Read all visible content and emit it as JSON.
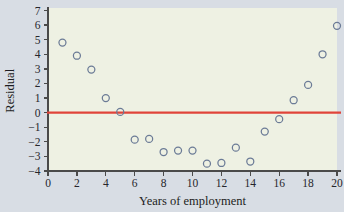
{
  "chart_data": {
    "type": "scatter",
    "title": "",
    "xlabel": "Years of employment",
    "ylabel": "Residual",
    "xlim": [
      0,
      20
    ],
    "ylim": [
      -4,
      7
    ],
    "xticks": [
      0,
      2,
      4,
      6,
      8,
      10,
      12,
      14,
      16,
      18,
      20
    ],
    "yticks": [
      -4,
      -3,
      -2,
      -1,
      0,
      1,
      2,
      3,
      4,
      5,
      6,
      7
    ],
    "xtick_labels": [
      "0",
      "2",
      "4",
      "6",
      "8",
      "10",
      "12",
      "14",
      "16",
      "18",
      "20"
    ],
    "ytick_labels": [
      "−4",
      "−3",
      "−2",
      "−1",
      "0",
      "1",
      "2",
      "3",
      "4",
      "5",
      "6",
      "7"
    ],
    "grid": false,
    "legend": "none",
    "marker": "open-circle",
    "marker_color": "#6b7b96",
    "panel_color": "#eef1e3",
    "figure_color": "#d8dde4",
    "reference_line": {
      "name": "zero-residual-line",
      "orientation": "horizontal",
      "y": 0,
      "color": "#e0443a"
    },
    "x": [
      1,
      2,
      3,
      4,
      5,
      6,
      7,
      8,
      9,
      10,
      11,
      12,
      13,
      14,
      15,
      16,
      17,
      18,
      19,
      20
    ],
    "y": [
      4.8,
      3.9,
      2.95,
      1.0,
      0.05,
      -1.85,
      -1.8,
      -2.7,
      -2.6,
      -2.6,
      -3.5,
      -3.45,
      -2.4,
      -3.35,
      -1.3,
      -0.45,
      0.85,
      1.9,
      4.0,
      5.95
    ],
    "points": [
      {
        "x": 1,
        "y": 4.8
      },
      {
        "x": 2,
        "y": 3.9
      },
      {
        "x": 3,
        "y": 2.95
      },
      {
        "x": 4,
        "y": 1.0
      },
      {
        "x": 5,
        "y": 0.05
      },
      {
        "x": 6,
        "y": -1.85
      },
      {
        "x": 7,
        "y": -1.8
      },
      {
        "x": 8,
        "y": -2.7
      },
      {
        "x": 9,
        "y": -2.6
      },
      {
        "x": 10,
        "y": -2.6
      },
      {
        "x": 11,
        "y": -3.5
      },
      {
        "x": 12,
        "y": -3.45
      },
      {
        "x": 13,
        "y": -2.4
      },
      {
        "x": 14,
        "y": -3.35
      },
      {
        "x": 15,
        "y": -1.3
      },
      {
        "x": 16,
        "y": -0.45
      },
      {
        "x": 17,
        "y": 0.85
      },
      {
        "x": 18,
        "y": 1.9
      },
      {
        "x": 19,
        "y": 4.0
      },
      {
        "x": 20,
        "y": 5.95
      }
    ]
  }
}
